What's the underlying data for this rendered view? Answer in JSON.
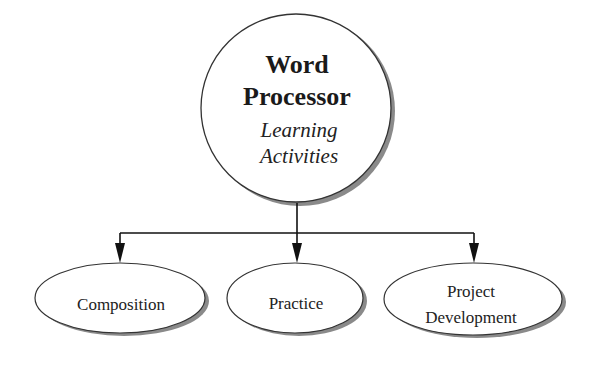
{
  "diagram": {
    "type": "hierarchy",
    "root": {
      "title_lines": [
        "Word",
        "Processor"
      ],
      "subtitle_lines": [
        "Learning",
        "Activities"
      ]
    },
    "children": [
      {
        "label_lines": [
          "Composition"
        ]
      },
      {
        "label_lines": [
          "Practice"
        ]
      },
      {
        "label_lines": [
          "Project",
          "Development"
        ]
      }
    ],
    "colors": {
      "background": "#ffffff",
      "stroke": "#333333",
      "shadow": "#8a8a8a",
      "text": "#1a1a1a",
      "arrow": "#111111"
    }
  }
}
